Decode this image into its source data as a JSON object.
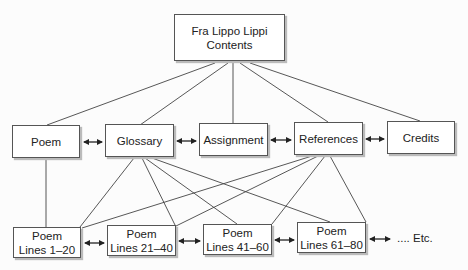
{
  "root": {
    "line1": "Fra Lippo Lippi",
    "line2": "Contents"
  },
  "sections": [
    {
      "label": "Poem"
    },
    {
      "label": "Glossary"
    },
    {
      "label": "Assignment"
    },
    {
      "label": "References"
    },
    {
      "label": "Credits"
    }
  ],
  "poem_parts": [
    {
      "title": "Poem",
      "range": "Lines 1–20"
    },
    {
      "title": "Poem",
      "range": "Lines 21–40"
    },
    {
      "title": "Poem",
      "range": "Lines 41–60"
    },
    {
      "title": "Poem",
      "range": "Lines 61–80"
    }
  ],
  "continuation": ".... Etc."
}
